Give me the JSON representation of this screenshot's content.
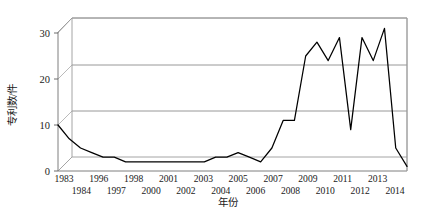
{
  "chart_data": {
    "type": "line",
    "title": "",
    "xlabel": "年份",
    "ylabel": "专利数/件",
    "ylim": [
      0,
      32
    ],
    "yticks": [
      0,
      10,
      20,
      30
    ],
    "ytick_labels": [
      "0",
      "10",
      "20",
      "30"
    ],
    "grid": true,
    "legend": "none",
    "three_d": true,
    "categories": [
      "1983",
      "1984",
      "1985",
      "1986",
      "1987",
      "1988",
      "1989",
      "1990",
      "1991",
      "1992",
      "1993",
      "1994",
      "1995",
      "1996",
      "1997",
      "1998",
      "1999",
      "2000",
      "2001",
      "2002",
      "2003",
      "2004",
      "2005",
      "2006",
      "2007",
      "2008",
      "2009",
      "2010",
      "2011",
      "2012",
      "2013",
      "2014"
    ],
    "xtick_labels_row1": [
      "1983",
      "",
      "1996",
      "",
      "1998",
      "",
      "2001",
      "",
      "2003",
      "",
      "2005",
      "",
      "2007",
      "",
      "2009",
      "",
      "2011",
      "",
      "2013",
      ""
    ],
    "xtick_labels_row2": [
      "",
      "1984",
      "",
      "1997",
      "",
      "2000",
      "",
      "2002",
      "",
      "2004",
      "",
      "2006",
      "",
      "2008",
      "",
      "2010",
      "",
      "2012",
      "",
      "2014"
    ],
    "values": [
      10,
      7,
      5,
      4,
      3,
      3,
      2,
      2,
      2,
      2,
      2,
      2,
      2,
      2,
      3,
      3,
      4,
      3,
      2,
      5,
      11,
      11,
      25,
      28,
      24,
      29,
      9,
      29,
      24,
      31,
      5,
      1
    ],
    "series": [
      {
        "name": "专利数",
        "color": "#000000",
        "values": [
          10,
          7,
          5,
          4,
          3,
          3,
          2,
          2,
          2,
          2,
          2,
          2,
          2,
          2,
          3,
          3,
          4,
          3,
          2,
          5,
          11,
          11,
          25,
          28,
          24,
          29,
          9,
          29,
          24,
          31,
          5,
          1
        ]
      }
    ]
  },
  "axes": {
    "y_title": "专利数/件",
    "x_title": "年份",
    "y_tick_0": "0",
    "y_tick_10": "10",
    "y_tick_20": "20",
    "y_tick_30": "30"
  },
  "x_labels": {
    "upper": [
      "1983",
      "1996",
      "1998",
      "2001",
      "2003",
      "2005",
      "2007",
      "2009",
      "2011",
      "2013"
    ],
    "lower": [
      "1984",
      "1997",
      "2000",
      "2002",
      "2004",
      "2006",
      "2008",
      "2010",
      "2012",
      "2014"
    ]
  },
  "colors": {
    "line": "#000000",
    "grid": "#8d8d8d",
    "frame": "#9a9a9a",
    "background": "#ffffff",
    "text": "#1a1a1a"
  }
}
